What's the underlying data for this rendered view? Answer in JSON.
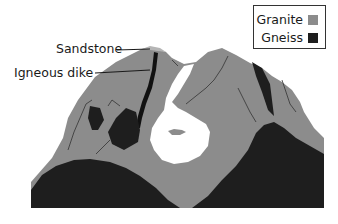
{
  "diagram": {
    "labels": {
      "sandstone": "Sandstone",
      "igneous_dike": "Igneous dike"
    },
    "legend": {
      "items": [
        {
          "label": "Granite",
          "color": "#8c8c8c"
        },
        {
          "label": "Gneiss",
          "color": "#1e1e1e"
        }
      ]
    },
    "colors": {
      "granite": "#8c8c8c",
      "gneiss": "#1e1e1e",
      "sandstone": "#b5b5b5",
      "dike": "#111111",
      "background": "#ffffff"
    }
  }
}
